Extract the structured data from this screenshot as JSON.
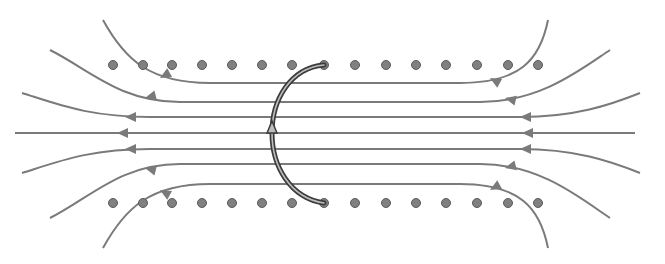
{
  "diagram": {
    "colors": {
      "background": "#ffffff",
      "field_line": "#7a7a7a",
      "dot_fill": "#808080",
      "dot_stroke": "#5a5a5a",
      "loop_outer": "#3c3c3c",
      "loop_inner": "#bdbdbd"
    },
    "dots": {
      "radius": 4.5,
      "x": [
        113,
        143,
        172,
        202,
        232,
        262,
        292,
        324,
        355,
        386,
        416,
        446,
        477,
        508,
        538
      ],
      "rows_y": [
        65,
        203
      ]
    },
    "field_lines": [
      {
        "id": "line-1",
        "d": "M103,20 C125,60 150,83 210,83 L460,83 C520,83 540,60 548,20",
        "arrows": [
          [
            160,
            78,
            -0.55
          ],
          [
            490,
            78,
            0.55
          ]
        ]
      },
      {
        "id": "line-2",
        "d": "M50,50 C90,70 120,102 180,102 L480,102 C540,102 580,70 610,50",
        "arrows": [
          [
            145,
            98,
            -0.25
          ],
          [
            505,
            98,
            0.25
          ]
        ]
      },
      {
        "id": "line-3",
        "d": "M22,93 C60,105 90,117 150,117 L520,117 C575,117 610,105 640,93",
        "arrows": [
          [
            125,
            117,
            0
          ],
          [
            520,
            117,
            0
          ]
        ]
      },
      {
        "id": "line-4",
        "d": "M15,133 L635,133",
        "arrows": [
          [
            117,
            133,
            0
          ],
          [
            522,
            133,
            0
          ]
        ]
      },
      {
        "id": "line-5",
        "d": "M22,173 C60,161 90,149 150,149 L520,149 C575,149 610,161 640,173",
        "arrows": [
          [
            125,
            149,
            0
          ],
          [
            520,
            149,
            0
          ]
        ]
      },
      {
        "id": "line-6",
        "d": "M50,218 C90,198 120,164 180,164 L480,164 C540,164 580,198 610,218",
        "arrows": [
          [
            145,
            168,
            0.25
          ],
          [
            505,
            168,
            -0.25
          ]
        ]
      },
      {
        "id": "line-7",
        "d": "M103,248 C125,208 150,184 210,184 L460,184 C520,184 540,208 548,248",
        "arrows": [
          [
            160,
            190,
            0.55
          ],
          [
            490,
            190,
            -0.55
          ]
        ]
      }
    ],
    "loop": {
      "d": "M324,65 C290,68 272,100 272,133 C272,166 290,198 324,203",
      "arrow": {
        "x": 272,
        "y": 128,
        "direction": "up"
      }
    }
  }
}
